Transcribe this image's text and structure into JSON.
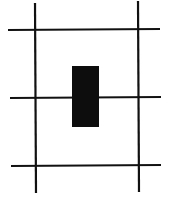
{
  "diagram": {
    "type": "grid-with-block",
    "background": "#ffffff",
    "line_color": "#111111",
    "fill_color": "#0d0d0d",
    "vertical_lines": [
      {
        "x1": 35,
        "y1": 3,
        "x2": 36,
        "y2": 193
      },
      {
        "x1": 138,
        "y1": 1,
        "x2": 139,
        "y2": 192
      }
    ],
    "horizontal_lines": [
      {
        "x1": 8,
        "y1": 30,
        "x2": 160,
        "y2": 29
      },
      {
        "x1": 10,
        "y1": 98,
        "x2": 161,
        "y2": 97
      },
      {
        "x1": 11,
        "y1": 166,
        "x2": 161,
        "y2": 165
      }
    ],
    "block": {
      "x": 72,
      "y": 66,
      "width": 27,
      "height": 61
    }
  }
}
